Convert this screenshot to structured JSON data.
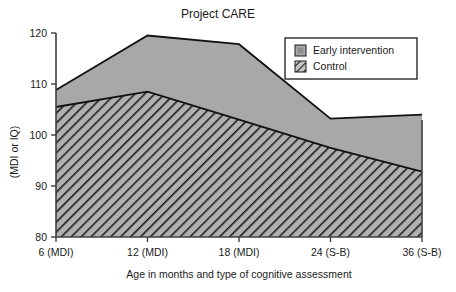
{
  "chart_data": {
    "type": "area",
    "title": "Project CARE",
    "xlabel": "Age in months and type of cognitive assessment",
    "ylabel": "(MDI or IQ)",
    "categories": [
      "6 (MDI)",
      "12 (MDI)",
      "18 (MDI)",
      "24 (S-B)",
      "36 (S-B)"
    ],
    "x_tick_labels": [
      "6 (MDI)",
      "12 (MDI)",
      "18 (MDI)",
      "24 (S-B)",
      "36 (S-B)"
    ],
    "y_tick_labels": [
      "80",
      "90",
      "100",
      "110",
      "120"
    ],
    "y_ticks": [
      80,
      90,
      100,
      110,
      120
    ],
    "ylim": [
      80,
      120
    ],
    "grid": false,
    "legend_position": "top-right",
    "series": [
      {
        "name": "Early intervention",
        "values": [
          108.8,
          119.5,
          117.8,
          103.2,
          104.0
        ],
        "fill": "gray",
        "color": "#a8a8a8"
      },
      {
        "name": "Control",
        "values": [
          105.5,
          108.5,
          103.0,
          97.5,
          92.8
        ],
        "fill": "hatched",
        "color": "#b0b0b0"
      }
    ]
  },
  "legend": {
    "items": [
      {
        "label": "Early intervention",
        "swatch": "gray-square-swatch"
      },
      {
        "label": "Control",
        "swatch": "hatched-square-swatch"
      }
    ]
  },
  "colors": {
    "early_intervention_fill": "#a8a8a8",
    "control_fill": "#b0b0b0",
    "hatch_stroke": "#1a1a1a",
    "axis": "#404040",
    "text": "#1a1a1a",
    "background": "#ffffff"
  }
}
